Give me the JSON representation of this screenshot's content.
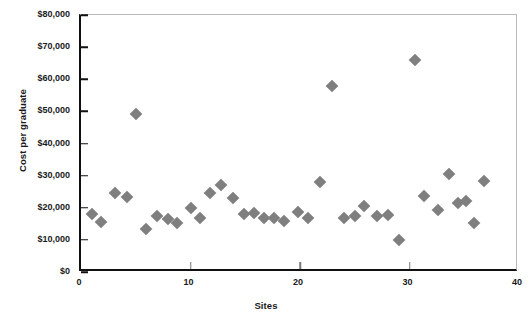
{
  "chart_data": {
    "type": "scatter",
    "title": "",
    "xlabel": "Sites",
    "ylabel": "Cost per graduate",
    "xlim": [
      0,
      40
    ],
    "ylim": [
      0,
      80000
    ],
    "grid": false,
    "legend": "none",
    "marker": {
      "shape": "diamond",
      "color": "#7f7f7f",
      "size": 9
    },
    "xticks": [
      0,
      10,
      20,
      30,
      40
    ],
    "xtick_labels": [
      "0",
      "10",
      "20",
      "30",
      "40"
    ],
    "yticks": [
      0,
      10000,
      20000,
      30000,
      40000,
      50000,
      60000,
      70000,
      80000
    ],
    "ytick_labels": [
      "$0",
      "$10,000",
      "$20,000",
      "$30,000",
      "$40,000",
      "$50,000",
      "$60,000",
      "$70,000",
      "$80,000"
    ],
    "series": [
      {
        "name": "Sites",
        "points": [
          {
            "x": 1,
            "y": 18200
          },
          {
            "x": 1.8,
            "y": 15700
          },
          {
            "x": 3.1,
            "y": 24700
          },
          {
            "x": 4.2,
            "y": 23400
          },
          {
            "x": 5.0,
            "y": 49300
          },
          {
            "x": 5.9,
            "y": 13500
          },
          {
            "x": 6.9,
            "y": 17500
          },
          {
            "x": 7.9,
            "y": 16600
          },
          {
            "x": 8.8,
            "y": 15300
          },
          {
            "x": 10.0,
            "y": 20000
          },
          {
            "x": 10.9,
            "y": 16700
          },
          {
            "x": 11.8,
            "y": 24700
          },
          {
            "x": 12.8,
            "y": 27200
          },
          {
            "x": 13.9,
            "y": 23100
          },
          {
            "x": 14.9,
            "y": 18200
          },
          {
            "x": 15.8,
            "y": 18500
          },
          {
            "x": 16.7,
            "y": 16900
          },
          {
            "x": 17.6,
            "y": 16900
          },
          {
            "x": 18.5,
            "y": 16000
          },
          {
            "x": 19.8,
            "y": 18800
          },
          {
            "x": 20.7,
            "y": 16900
          },
          {
            "x": 21.8,
            "y": 27900
          },
          {
            "x": 22.9,
            "y": 57800
          },
          {
            "x": 24.0,
            "y": 16700
          },
          {
            "x": 25.0,
            "y": 17300
          },
          {
            "x": 25.8,
            "y": 20600
          },
          {
            "x": 27.0,
            "y": 17500
          },
          {
            "x": 28.0,
            "y": 17800
          },
          {
            "x": 29.0,
            "y": 10100
          },
          {
            "x": 30.5,
            "y": 66000
          },
          {
            "x": 31.3,
            "y": 23600
          },
          {
            "x": 32.6,
            "y": 19200
          },
          {
            "x": 33.6,
            "y": 30400
          },
          {
            "x": 34.4,
            "y": 21400
          },
          {
            "x": 35.2,
            "y": 22000
          },
          {
            "x": 35.9,
            "y": 15100
          },
          {
            "x": 36.8,
            "y": 28200
          }
        ]
      }
    ]
  }
}
